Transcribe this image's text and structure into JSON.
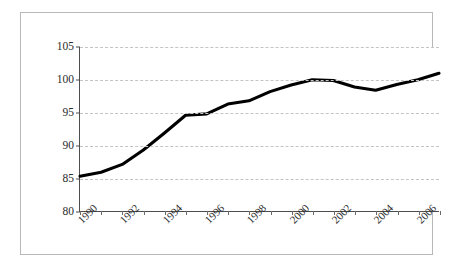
{
  "chart_data": {
    "type": "line",
    "title": "",
    "subtitle": "",
    "xlabel": "",
    "ylabel": "",
    "grid": "horizontal-dashed",
    "legend": "none",
    "xlim": [
      1990,
      2007
    ],
    "ylim": [
      80,
      105
    ],
    "y_ticks": [
      105,
      100,
      95,
      90,
      85,
      80
    ],
    "x_tick_labels": [
      "1990",
      "1992",
      "1994",
      "1996",
      "1998",
      "2000",
      "2002",
      "2004",
      "2006"
    ],
    "x_tick_label_rotation": -45,
    "x_minor_ticks": [
      1990,
      1991,
      1992,
      1993,
      1994,
      1995,
      1996,
      1997,
      1998,
      1999,
      2000,
      2001,
      2002,
      2003,
      2004,
      2005,
      2006,
      2007
    ],
    "series": [
      {
        "name": "index",
        "color": "#000000",
        "x": [
          1990,
          1991,
          1992,
          1993,
          1994,
          1995,
          1996,
          1997,
          1998,
          1999,
          2000,
          2001,
          2002,
          2003,
          2004,
          2005,
          2006,
          2007
        ],
        "values": [
          85.3,
          85.9,
          87.1,
          89.3,
          91.9,
          94.6,
          94.8,
          96.3,
          96.8,
          98.2,
          99.2,
          100.0,
          99.9,
          98.9,
          98.4,
          99.3,
          100.0,
          101.0
        ]
      }
    ]
  }
}
